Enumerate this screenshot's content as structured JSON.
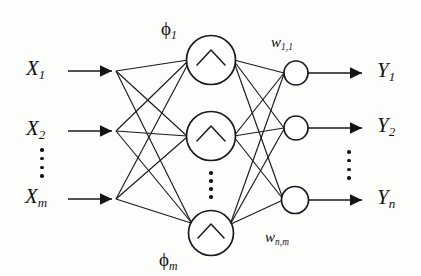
{
  "figure": {
    "type": "neural-network-diagram",
    "title": "",
    "colors": {
      "stroke": "#1a1a1a",
      "background": "#fdfdfc",
      "text": "#131313"
    },
    "layers": {
      "input": {
        "name": "input-layer",
        "count_label": "m",
        "nodes": [
          {
            "base": "X",
            "sub": "1",
            "text": "X1"
          },
          {
            "base": "X",
            "sub": "2",
            "text": "X2"
          },
          {
            "base": "X",
            "sub": "m",
            "text": "Xm"
          }
        ],
        "ellipsis": "vertical-dots"
      },
      "hidden": {
        "name": "hidden-layer",
        "count_label": "m",
        "activation_glyph": "caret",
        "nodes": [
          {
            "base": "ϕ",
            "sub": "1",
            "text": "ϕ1"
          },
          {
            "base": "ϕ",
            "sub": "",
            "text": ""
          },
          {
            "base": "ϕ",
            "sub": "m",
            "text": "ϕm"
          }
        ],
        "ellipsis": "vertical-dots"
      },
      "output": {
        "name": "output-layer",
        "count_label": "n",
        "nodes": [
          {
            "base": "Y",
            "sub": "1",
            "text": "Y1"
          },
          {
            "base": "Y",
            "sub": "2",
            "text": "Y2"
          },
          {
            "base": "Y",
            "sub": "n",
            "text": "Yn"
          }
        ],
        "ellipsis": "vertical-dots"
      }
    },
    "weights": [
      {
        "base": "w",
        "sub": "1,1",
        "text": "w1,1"
      },
      {
        "base": "w",
        "sub": "n,m",
        "text": "wn,m"
      }
    ]
  }
}
